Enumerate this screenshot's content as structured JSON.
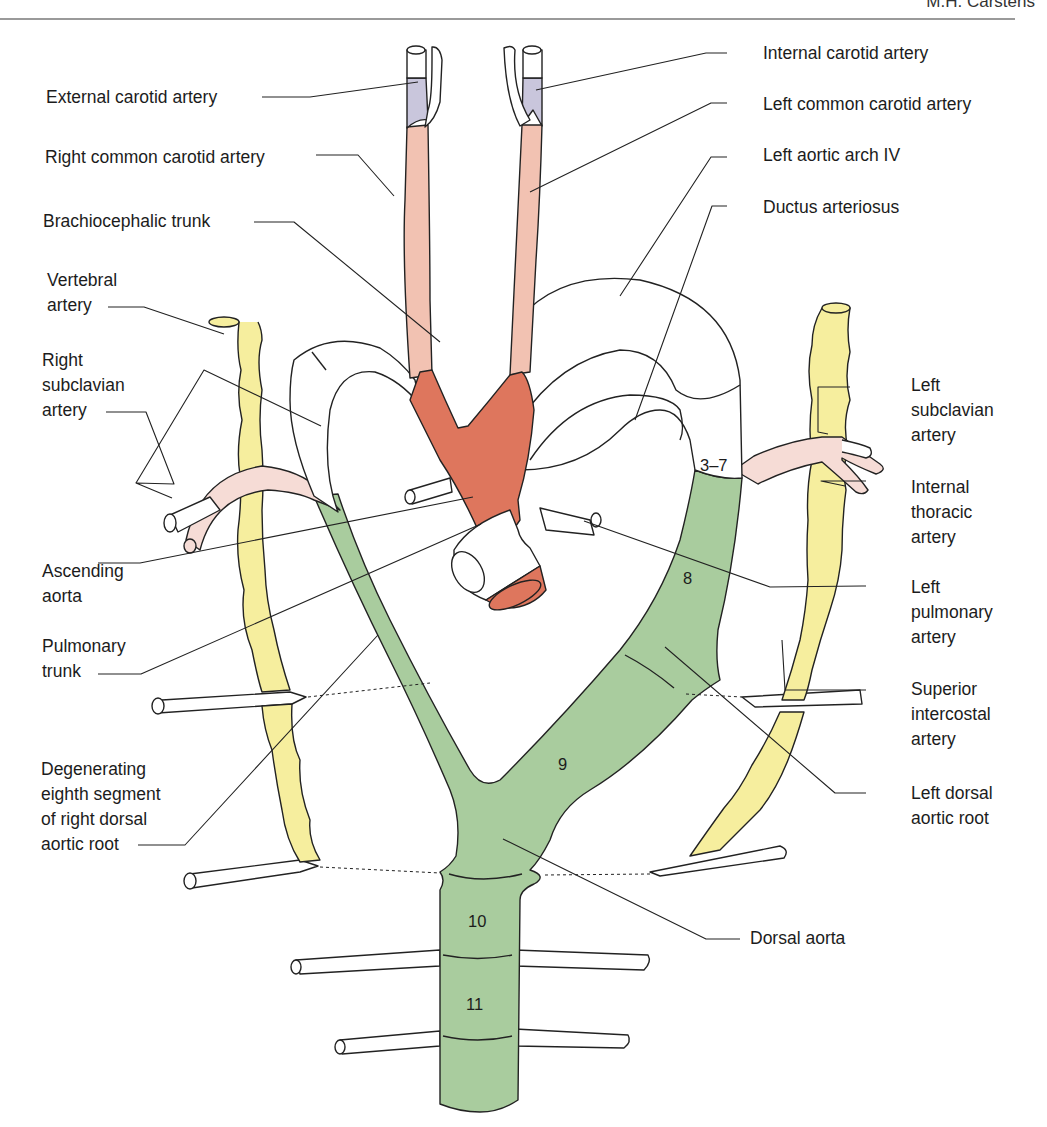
{
  "header": {
    "running_head": "M.H. Carstens"
  },
  "colors": {
    "dorsal_aorta_green": "#a9cc9e",
    "aortic_sac_red": "#de765d",
    "carotid_pink": "#f2c2b2",
    "external_carotid_lavender": "#c9c6dc",
    "subclavian_pink": "#f6dcd6",
    "vertebral_yellow": "#f6ee9e",
    "outline": "#222222"
  },
  "labels": {
    "internal_carotid": "Internal carotid artery",
    "external_carotid": "External carotid artery",
    "left_common_carotid": "Left common carotid artery",
    "right_common_carotid": "Right common carotid artery",
    "left_aortic_arch": "Left aortic arch IV",
    "brachiocephalic": "Brachiocephalic trunk",
    "ductus": "Ductus arteriosus",
    "vertebral": "Vertebral\nartery",
    "right_subclavian": "Right\nsubclavian\nartery",
    "left_subclavian": "Left\nsubclavian\nartery",
    "internal_thoracic": "Internal\nthoracic\nartery",
    "ascending_aorta": "Ascending\naorta",
    "left_pulmonary": "Left\npulmonary\nartery",
    "pulmonary_trunk": "Pulmonary\ntrunk",
    "superior_intercostal": "Superior\nintercostal\nartery",
    "degenerating": "Degenerating\neighth segment\nof right dorsal\naortic root",
    "left_dorsal_root": "Left dorsal\naortic root",
    "dorsal_aorta": "Dorsal aorta"
  },
  "segments": {
    "s3_7": "3–7",
    "s8": "8",
    "s9": "9",
    "s10": "10",
    "s11": "11"
  }
}
